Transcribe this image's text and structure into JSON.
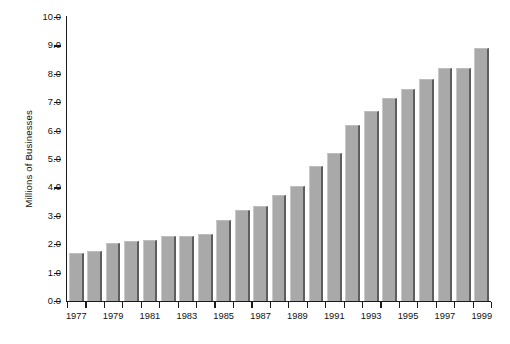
{
  "chart_data": {
    "type": "bar",
    "title": "",
    "xlabel": "",
    "ylabel": "Millions of Businesses",
    "ylim": [
      0.0,
      10.0
    ],
    "ytick_step": 1.0,
    "grid": false,
    "legend": false,
    "categories": [
      "1977",
      "1978",
      "1979",
      "1980",
      "1981",
      "1982",
      "1983",
      "1984",
      "1985",
      "1986",
      "1987",
      "1988",
      "1989",
      "1990",
      "1991",
      "1992",
      "1993",
      "1994",
      "1995",
      "1996",
      "1997",
      "1998",
      "1999"
    ],
    "values": [
      1.7,
      1.75,
      2.05,
      2.1,
      2.15,
      2.3,
      2.3,
      2.35,
      2.85,
      3.2,
      3.35,
      3.75,
      4.05,
      4.75,
      5.2,
      6.2,
      6.7,
      7.15,
      7.45,
      7.8,
      8.2,
      8.2,
      8.9
    ],
    "ytick_labels": [
      "10.0",
      "9.0",
      "8.0",
      "7.0",
      "6.0",
      "5.0",
      "4.0",
      "3.0",
      "2.0",
      "1.0",
      "0.0"
    ],
    "ytick_values": [
      10.0,
      9.0,
      8.0,
      7.0,
      6.0,
      5.0,
      4.0,
      3.0,
      2.0,
      1.0,
      0.0
    ],
    "xtick_labels": [
      "1977",
      "1979",
      "1981",
      "1983",
      "1985",
      "1987",
      "1989",
      "1991",
      "1993",
      "1995",
      "1997",
      "1999"
    ],
    "bar_color": "#a9a9a9",
    "bar_edge_color": "#5e5e5e",
    "axis_color": "#1a1a1a",
    "background_color": "#ffffff"
  }
}
